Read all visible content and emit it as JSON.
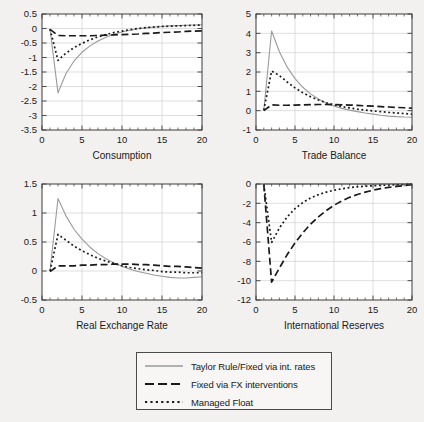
{
  "figure": {
    "background": "#f2f1ef",
    "axis_color": "#3c3c3c",
    "grid_color": "#c9c9c9"
  },
  "legend": {
    "position": "bottom-center",
    "entries": [
      {
        "label": "Taylor Rule/Fixed via int. rates",
        "style": "solid",
        "color": "#9a9a9a"
      },
      {
        "label": "Fixed via FX interventions",
        "style": "dashed",
        "color": "#1a1a1a"
      },
      {
        "label": "Managed Float",
        "style": "dotted",
        "color": "#1a1a1a"
      }
    ]
  },
  "chart_data": [
    {
      "type": "line",
      "title": "Consumption",
      "xlabel": "Consumption",
      "ylabel": "",
      "xlim": [
        0,
        20
      ],
      "ylim": [
        -3.5,
        0.5
      ],
      "xticks": [
        0,
        5,
        10,
        15,
        20
      ],
      "yticks": [
        0.5,
        0,
        -0.5,
        -1,
        -1.5,
        -2,
        -2.5,
        -3,
        -3.5
      ],
      "ytick_labels": [
        "0.5",
        "0",
        "-0.5",
        "-1",
        "-1.5",
        "-2",
        "-2.5",
        "-3",
        "-3.5"
      ],
      "grid": true,
      "x": [
        1,
        2,
        3,
        4,
        5,
        6,
        7,
        8,
        9,
        10,
        11,
        12,
        13,
        14,
        15,
        16,
        17,
        18,
        19,
        20
      ],
      "series": [
        {
          "name": "Taylor Rule/Fixed via int. rates",
          "style": "solid",
          "color": "#9a9a9a",
          "values": [
            -0.02,
            -2.22,
            -1.55,
            -1.12,
            -0.82,
            -0.6,
            -0.43,
            -0.3,
            -0.2,
            -0.12,
            -0.06,
            -0.01,
            0.02,
            0.05,
            0.07,
            0.09,
            0.1,
            0.11,
            0.12,
            0.13
          ]
        },
        {
          "name": "Fixed via FX interventions",
          "style": "dashed",
          "color": "#1a1a1a",
          "values": [
            -0.03,
            -0.24,
            -0.25,
            -0.25,
            -0.25,
            -0.25,
            -0.24,
            -0.23,
            -0.22,
            -0.21,
            -0.2,
            -0.19,
            -0.17,
            -0.16,
            -0.14,
            -0.13,
            -0.12,
            -0.1,
            -0.09,
            -0.08
          ]
        },
        {
          "name": "Managed Float",
          "style": "dotted",
          "color": "#1a1a1a",
          "values": [
            -0.02,
            -1.1,
            -0.85,
            -0.66,
            -0.51,
            -0.39,
            -0.29,
            -0.21,
            -0.14,
            -0.09,
            -0.04,
            0.0,
            0.03,
            0.05,
            0.07,
            0.08,
            0.09,
            0.1,
            0.11,
            0.12
          ]
        }
      ]
    },
    {
      "type": "line",
      "title": "Trade Balance",
      "xlabel": "Trade Balance",
      "ylabel": "",
      "xlim": [
        0,
        20
      ],
      "ylim": [
        -1,
        5
      ],
      "xticks": [
        0,
        5,
        10,
        15,
        20
      ],
      "yticks": [
        5,
        4,
        3,
        2,
        1,
        0,
        -1
      ],
      "ytick_labels": [
        "5",
        "4",
        "3",
        "2",
        "1",
        "0",
        "-1"
      ],
      "grid": true,
      "x": [
        1,
        2,
        3,
        4,
        5,
        6,
        7,
        8,
        9,
        10,
        11,
        12,
        13,
        14,
        15,
        16,
        17,
        18,
        19,
        20
      ],
      "series": [
        {
          "name": "Taylor Rule/Fixed via int. rates",
          "style": "solid",
          "color": "#9a9a9a",
          "values": [
            0.02,
            4.12,
            3.05,
            2.25,
            1.66,
            1.21,
            0.87,
            0.6,
            0.4,
            0.24,
            0.12,
            0.03,
            -0.05,
            -0.12,
            -0.18,
            -0.24,
            -0.28,
            -0.31,
            -0.33,
            -0.34
          ]
        },
        {
          "name": "Fixed via FX interventions",
          "style": "dashed",
          "color": "#1a1a1a",
          "values": [
            0.0,
            0.3,
            0.28,
            0.28,
            0.29,
            0.3,
            0.31,
            0.32,
            0.32,
            0.31,
            0.3,
            0.29,
            0.27,
            0.25,
            0.23,
            0.21,
            0.19,
            0.17,
            0.15,
            0.13
          ]
        },
        {
          "name": "Managed Float",
          "style": "dotted",
          "color": "#1a1a1a",
          "values": [
            0.02,
            2.05,
            1.82,
            1.48,
            1.18,
            0.93,
            0.72,
            0.55,
            0.41,
            0.3,
            0.21,
            0.14,
            0.08,
            0.03,
            -0.01,
            -0.05,
            -0.09,
            -0.12,
            -0.15,
            -0.18
          ]
        }
      ]
    },
    {
      "type": "line",
      "title": "Real Exchange Rate",
      "xlabel": "Real Exchange Rate",
      "ylabel": "",
      "xlim": [
        0,
        20
      ],
      "ylim": [
        -0.5,
        1.5
      ],
      "xticks": [
        0,
        5,
        10,
        15,
        20
      ],
      "yticks": [
        1.5,
        1,
        0.5,
        0,
        -0.5
      ],
      "ytick_labels": [
        "1.5",
        "1",
        "0.5",
        "0",
        "-0.5"
      ],
      "grid": true,
      "x": [
        1,
        2,
        3,
        4,
        5,
        6,
        7,
        8,
        9,
        10,
        11,
        12,
        13,
        14,
        15,
        16,
        17,
        18,
        19,
        20
      ],
      "series": [
        {
          "name": "Taylor Rule/Fixed via int. rates",
          "style": "solid",
          "color": "#9a9a9a",
          "values": [
            0.0,
            1.25,
            0.95,
            0.72,
            0.55,
            0.41,
            0.3,
            0.21,
            0.14,
            0.08,
            0.03,
            -0.01,
            -0.04,
            -0.07,
            -0.09,
            -0.11,
            -0.12,
            -0.12,
            -0.11,
            -0.1
          ]
        },
        {
          "name": "Fixed via FX interventions",
          "style": "dashed",
          "color": "#1a1a1a",
          "values": [
            -0.01,
            0.09,
            0.09,
            0.09,
            0.1,
            0.1,
            0.11,
            0.11,
            0.12,
            0.12,
            0.12,
            0.11,
            0.11,
            0.1,
            0.09,
            0.08,
            0.08,
            0.07,
            0.06,
            0.05
          ]
        },
        {
          "name": "Managed Float",
          "style": "dotted",
          "color": "#1a1a1a",
          "values": [
            0.0,
            0.63,
            0.53,
            0.43,
            0.35,
            0.28,
            0.22,
            0.17,
            0.13,
            0.09,
            0.06,
            0.04,
            0.02,
            0.01,
            -0.01,
            -0.02,
            -0.02,
            -0.03,
            -0.03,
            -0.03
          ]
        }
      ]
    },
    {
      "type": "line",
      "title": "International Reserves",
      "xlabel": "International Reserves",
      "ylabel": "",
      "xlim": [
        0,
        20
      ],
      "ylim": [
        -12,
        0
      ],
      "xticks": [
        0,
        5,
        10,
        15,
        20
      ],
      "yticks": [
        0,
        -2,
        -4,
        -6,
        -8,
        -10,
        -12
      ],
      "ytick_labels": [
        "0",
        "-2",
        "-4",
        "-6",
        "-8",
        "-10",
        "-12"
      ],
      "grid": true,
      "x": [
        1,
        2,
        3,
        4,
        5,
        6,
        7,
        8,
        9,
        10,
        11,
        12,
        13,
        14,
        15,
        16,
        17,
        18,
        19,
        20
      ],
      "series": [
        {
          "name": "Taylor Rule/Fixed via int. rates",
          "style": "solid",
          "color": "#9a9a9a",
          "values": [
            0,
            0,
            0,
            0,
            0,
            0,
            0,
            0,
            0,
            0,
            0,
            0,
            0,
            0,
            0,
            0,
            0,
            0,
            0,
            0
          ]
        },
        {
          "name": "Fixed via FX interventions",
          "style": "dashed",
          "color": "#1a1a1a",
          "values": [
            -0.05,
            -10.15,
            -8.7,
            -7.3,
            -6.1,
            -5.05,
            -4.15,
            -3.4,
            -2.75,
            -2.2,
            -1.75,
            -1.38,
            -1.08,
            -0.84,
            -0.64,
            -0.48,
            -0.35,
            -0.25,
            -0.16,
            -0.08
          ]
        },
        {
          "name": "Managed Float",
          "style": "dotted",
          "color": "#1a1a1a",
          "values": [
            -0.03,
            -6.05,
            -4.55,
            -3.4,
            -2.55,
            -1.92,
            -1.45,
            -1.1,
            -0.84,
            -0.64,
            -0.49,
            -0.38,
            -0.29,
            -0.23,
            -0.18,
            -0.14,
            -0.11,
            -0.08,
            -0.05,
            -0.02
          ]
        }
      ]
    }
  ]
}
